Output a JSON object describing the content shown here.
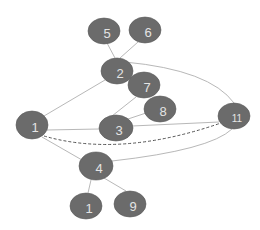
{
  "diagram": {
    "type": "graph",
    "colors": {
      "node_fill": "#6b6b6b",
      "node_label": "#e4e4e4",
      "edge_solid": "#b8b8b8",
      "edge_dashed": "#555555",
      "background": "#ffffff"
    },
    "nodes": [
      {
        "id": "n5",
        "label": "5",
        "cx": 104,
        "cy": 31,
        "rx": 16,
        "ry": 13
      },
      {
        "id": "n6",
        "label": "6",
        "cx": 145,
        "cy": 30,
        "rx": 16,
        "ry": 13
      },
      {
        "id": "n2",
        "label": "2",
        "cx": 117,
        "cy": 71,
        "rx": 16,
        "ry": 13
      },
      {
        "id": "n7",
        "label": "7",
        "cx": 144,
        "cy": 85,
        "rx": 16,
        "ry": 13
      },
      {
        "id": "n8",
        "label": "8",
        "cx": 160,
        "cy": 109,
        "rx": 16,
        "ry": 13
      },
      {
        "id": "n1a",
        "label": "1",
        "cx": 32,
        "cy": 125,
        "rx": 16,
        "ry": 14
      },
      {
        "id": "n3",
        "label": "3",
        "cx": 116,
        "cy": 128,
        "rx": 17,
        "ry": 13
      },
      {
        "id": "n11",
        "label": "11",
        "cx": 234,
        "cy": 116,
        "rx": 16,
        "ry": 13
      },
      {
        "id": "n4",
        "label": "4",
        "cx": 96,
        "cy": 166,
        "rx": 17,
        "ry": 14
      },
      {
        "id": "n1b",
        "label": "1",
        "cx": 86,
        "cy": 206,
        "rx": 16,
        "ry": 13
      },
      {
        "id": "n9",
        "label": "9",
        "cx": 130,
        "cy": 204,
        "rx": 16,
        "ry": 13
      }
    ],
    "edges": [
      {
        "from": "n5",
        "to": "n2",
        "style": "solid",
        "path": "M107,43 L115,58"
      },
      {
        "from": "n6",
        "to": "n2",
        "style": "solid",
        "path": "M138,42 L120,58"
      },
      {
        "from": "n2",
        "to": "n1a",
        "style": "solid",
        "path": "M105,80 L44,116"
      },
      {
        "from": "n2",
        "to": "n11",
        "style": "solid",
        "path": "M125,62 Q210,70 234,103"
      },
      {
        "from": "n7",
        "to": "n3",
        "style": "solid",
        "path": "M136,97 L112,116"
      },
      {
        "from": "n8",
        "to": "n3",
        "style": "solid",
        "path": "M146,113 L128,119"
      },
      {
        "from": "n1a",
        "to": "n3",
        "style": "solid",
        "path": "M47,130 L99,129"
      },
      {
        "from": "n3",
        "to": "n11",
        "style": "solid",
        "path": "M132,126 L219,122"
      },
      {
        "from": "n1a",
        "to": "n11",
        "style": "dashed",
        "path": "M44,136 Q120,158 221,123"
      },
      {
        "from": "n1a",
        "to": "n4",
        "style": "solid",
        "path": "M42,137 L82,160"
      },
      {
        "from": "n4",
        "to": "n11",
        "style": "solid",
        "path": "M112,161 Q210,150 232,129"
      },
      {
        "from": "n4",
        "to": "n1b",
        "style": "solid",
        "path": "M91,180 L88,193"
      },
      {
        "from": "n4",
        "to": "n9",
        "style": "solid",
        "path": "M104,178 L126,191"
      }
    ]
  }
}
